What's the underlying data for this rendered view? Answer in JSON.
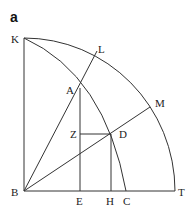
{
  "figure": {
    "panel_label": "a",
    "points": {
      "K": {
        "label": "K"
      },
      "L": {
        "label": "L"
      },
      "A": {
        "label": "A"
      },
      "M": {
        "label": "M"
      },
      "Z": {
        "label": "Z"
      },
      "D": {
        "label": "D"
      },
      "B": {
        "label": "B"
      },
      "E": {
        "label": "E"
      },
      "H": {
        "label": "H"
      },
      "C": {
        "label": "C"
      },
      "T": {
        "label": "T"
      }
    },
    "colors": {
      "stroke": "#333333",
      "text": "#222222",
      "background": "#ffffff"
    }
  }
}
